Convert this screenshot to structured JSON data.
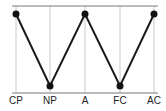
{
  "chart_data": {
    "type": "line",
    "title": "",
    "xlabel": "",
    "ylabel": "",
    "categories": [
      "CP",
      "NP",
      "A",
      "FC",
      "AC"
    ],
    "series": [
      {
        "name": "",
        "values": [
          1,
          0,
          1,
          0,
          1
        ]
      }
    ],
    "ylim": [
      0,
      1
    ],
    "grid": {
      "vertical": true,
      "horizontal_top": true,
      "horizontal_bottom": true
    },
    "legend": "none",
    "colors": {
      "line": "#1a1a1a",
      "marker": "#111111",
      "grid": "#c8c8c8",
      "axis": "#777777"
    }
  },
  "layout": {
    "x_pixels": [
      16,
      50,
      85,
      120,
      154
    ],
    "y_top": 14,
    "y_bottom": 86,
    "top_line_y": 6,
    "baseline_y": 93,
    "line_left": 12,
    "line_right": 158,
    "label_y": 104
  }
}
